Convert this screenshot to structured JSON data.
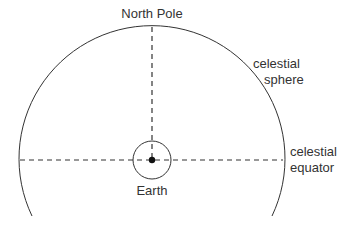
{
  "diagram": {
    "labels": {
      "north_pole": "North Pole",
      "celestial_sphere_line1": "celestial",
      "celestial_sphere_line2": "sphere",
      "celestial_equator_line1": "celestial",
      "celestial_equator_line2": "equator",
      "earth": "Earth"
    },
    "colors": {
      "line": "#333333",
      "background": "#ffffff"
    }
  }
}
